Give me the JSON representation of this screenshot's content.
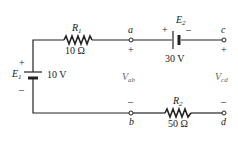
{
  "components": {
    "R1": {
      "name": "R",
      "sub": "1",
      "value": "10 Ω"
    },
    "R2": {
      "name": "R",
      "sub": "2",
      "value": "50 Ω"
    },
    "E1": {
      "name": "E",
      "sub": "1",
      "value": "10 V",
      "plus": "+",
      "minus": "–"
    },
    "E2": {
      "name": "E",
      "sub": "2",
      "value": "30 V",
      "plus": "+",
      "minus": "–"
    }
  },
  "nodes": {
    "a": {
      "label": "a",
      "polarity": "+"
    },
    "b": {
      "label": "b",
      "polarity": "–"
    },
    "c": {
      "label": "c",
      "polarity": "+"
    },
    "d": {
      "label": "d",
      "polarity": "–"
    }
  },
  "voltages": {
    "Vab": {
      "name": "V",
      "sub": "ab"
    },
    "Vcd": {
      "name": "V",
      "sub": "cd"
    }
  }
}
